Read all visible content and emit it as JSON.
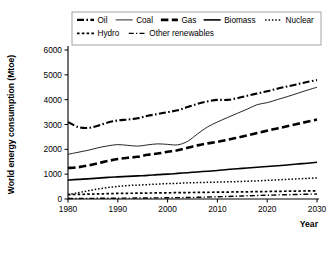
{
  "chart_data": {
    "type": "line",
    "title": "",
    "xlabel": "Year",
    "ylabel": "World energy consumption (Mtoe)",
    "xlim": [
      1980,
      2030
    ],
    "ylim": [
      0,
      6000
    ],
    "xticks": [
      "1980",
      "1990",
      "2000",
      "2010",
      "2020",
      "2030"
    ],
    "yticks": [
      "0",
      "1000",
      "2000",
      "3000",
      "4000",
      "5000",
      "6000"
    ],
    "grid": false,
    "legend_position": "top",
    "x": [
      1980,
      1982,
      1984,
      1986,
      1988,
      1990,
      1992,
      1994,
      1996,
      1998,
      2000,
      2002,
      2004,
      2006,
      2008,
      2010,
      2012,
      2014,
      2016,
      2018,
      2020,
      2022,
      2024,
      2026,
      2028,
      2030
    ],
    "series": [
      {
        "name": "Oil",
        "style": "dash-dot",
        "width": 2.1,
        "values": [
          3100,
          2900,
          2860,
          2950,
          3080,
          3160,
          3200,
          3250,
          3350,
          3420,
          3500,
          3570,
          3700,
          3830,
          3930,
          3990,
          3990,
          4060,
          4160,
          4250,
          4340,
          4440,
          4530,
          4620,
          4710,
          4790
        ]
      },
      {
        "name": "Coal",
        "style": "solid-thin",
        "width": 0.85,
        "values": [
          1800,
          1880,
          1960,
          2060,
          2140,
          2190,
          2160,
          2130,
          2180,
          2220,
          2200,
          2180,
          2320,
          2620,
          2900,
          3100,
          3280,
          3450,
          3620,
          3800,
          3880,
          4000,
          4120,
          4250,
          4380,
          4500
        ]
      },
      {
        "name": "Gas",
        "style": "long-dash",
        "width": 2.6,
        "values": [
          1250,
          1280,
          1350,
          1440,
          1530,
          1610,
          1660,
          1700,
          1780,
          1830,
          1900,
          1960,
          2060,
          2160,
          2240,
          2300,
          2380,
          2470,
          2560,
          2660,
          2750,
          2840,
          2930,
          3020,
          3110,
          3200
        ]
      },
      {
        "name": "Biomass",
        "style": "solid",
        "width": 1.6,
        "values": [
          760,
          790,
          810,
          840,
          870,
          890,
          910,
          930,
          950,
          980,
          1000,
          1030,
          1060,
          1090,
          1120,
          1150,
          1190,
          1220,
          1250,
          1280,
          1310,
          1340,
          1370,
          1410,
          1440,
          1480
        ]
      },
      {
        "name": "Nuclear",
        "style": "fine-dot",
        "width": 1.5,
        "values": [
          180,
          250,
          330,
          400,
          460,
          510,
          540,
          560,
          580,
          600,
          620,
          630,
          650,
          660,
          670,
          680,
          690,
          700,
          715,
          730,
          750,
          770,
          790,
          810,
          830,
          850
        ]
      },
      {
        "name": "Hydro",
        "style": "small-dash",
        "width": 1.7,
        "values": [
          175,
          185,
          195,
          205,
          215,
          225,
          230,
          235,
          240,
          245,
          250,
          255,
          260,
          265,
          270,
          275,
          280,
          285,
          290,
          296,
          302,
          308,
          314,
          320,
          325,
          330
        ]
      },
      {
        "name": "Other renewables",
        "style": "thin-dash-dot",
        "width": 1.4,
        "values": [
          20,
          22,
          25,
          28,
          30,
          33,
          36,
          38,
          42,
          45,
          50,
          55,
          60,
          68,
          78,
          90,
          102,
          115,
          128,
          140,
          152,
          163,
          172,
          182,
          192,
          200
        ]
      }
    ]
  },
  "legend": {
    "rows": [
      [
        {
          "label": "Oil",
          "style": "dash-dot"
        },
        {
          "label": "Coal",
          "style": "solid-thin"
        },
        {
          "label": "Gas",
          "style": "long-dash"
        },
        {
          "label": "Biomass",
          "style": "solid"
        },
        {
          "label": "Nuclear",
          "style": "fine-dot"
        }
      ],
      [
        {
          "label": "Hydro",
          "style": "small-dash"
        },
        {
          "label": "Other renewables",
          "style": "thin-dash-dot"
        }
      ]
    ]
  }
}
